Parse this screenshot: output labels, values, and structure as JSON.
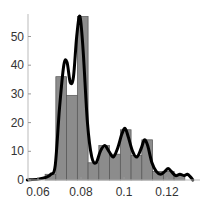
{
  "chart_data": {
    "type": "bar",
    "subtype": "histogram with density curve overlay",
    "title": "",
    "xlabel": "",
    "ylabel": "",
    "xlim": [
      0.055,
      0.132
    ],
    "ylim": [
      0,
      58
    ],
    "x_ticks": [
      "0.06",
      "0.08",
      "0.1",
      "0.12"
    ],
    "x_tick_values": [
      0.06,
      0.08,
      0.1,
      0.12
    ],
    "y_ticks": [
      "0",
      "10",
      "20",
      "30",
      "40",
      "50"
    ],
    "y_tick_values": [
      0,
      10,
      20,
      30,
      40,
      50
    ],
    "grid": false,
    "legend": null,
    "bin_width": 0.005,
    "bin_edges": [
      0.0633,
      0.0683,
      0.0733,
      0.0783,
      0.0833,
      0.0883,
      0.0933,
      0.0983,
      0.1033,
      0.1083,
      0.1133,
      0.1183,
      0.1233,
      0.1283
    ],
    "values": [
      2,
      36,
      29.5,
      57,
      6,
      12,
      9,
      17.5,
      8.5,
      14,
      3,
      3,
      2
    ],
    "bar_color": "#8c8c8c",
    "bar_edge_color": "#555555",
    "curve": {
      "name": "density",
      "color": "#000000",
      "x": [
        0.055,
        0.06,
        0.064,
        0.066,
        0.068,
        0.07,
        0.072,
        0.0735,
        0.075,
        0.0765,
        0.078,
        0.0795,
        0.081,
        0.083,
        0.085,
        0.087,
        0.089,
        0.091,
        0.093,
        0.095,
        0.097,
        0.099,
        0.1005,
        0.102,
        0.104,
        0.106,
        0.108,
        0.1095,
        0.111,
        0.113,
        0.115,
        0.117,
        0.119,
        0.1205,
        0.122,
        0.124,
        0.126,
        0.128,
        0.1295,
        0.131,
        0.132
      ],
      "y": [
        0,
        0.3,
        1,
        2,
        5,
        25,
        40,
        41,
        34,
        36,
        50,
        57,
        45,
        20,
        8,
        6,
        10,
        12,
        10,
        8,
        11,
        16,
        18,
        15,
        10,
        8,
        11,
        14,
        12,
        6,
        3,
        2,
        3,
        4,
        3,
        1.5,
        2,
        1.5,
        2,
        1,
        0
      ]
    }
  }
}
